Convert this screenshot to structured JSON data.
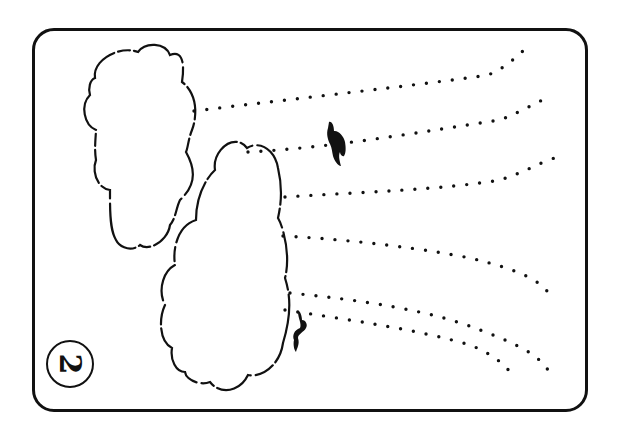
{
  "card": {
    "number": "2",
    "stroke_color": "#111111",
    "background": "#ffffff"
  },
  "scene": {
    "clouds": [
      {
        "name": "upper-left-cloud"
      },
      {
        "name": "lower-right-cloud"
      }
    ],
    "wind_lines_count": 6,
    "figures": [
      {
        "name": "upper-figure",
        "icon": "falling-person-icon"
      },
      {
        "name": "lower-figure",
        "icon": "falling-person-icon"
      }
    ]
  }
}
